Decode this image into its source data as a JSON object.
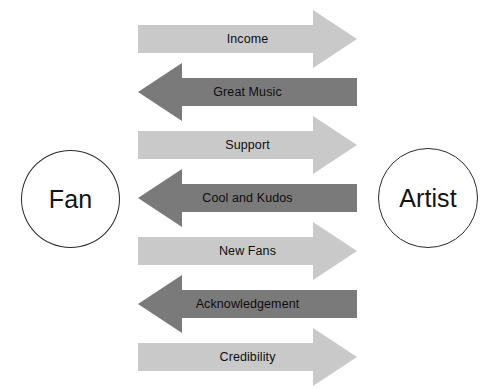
{
  "diagram": {
    "background_color": "#ffffff",
    "nodes": {
      "left": {
        "label": "Fan",
        "name": "fan-node"
      },
      "right": {
        "label": "Artist",
        "name": "Artist"
      }
    },
    "colors": {
      "arrow_right": "#c9c9c9",
      "arrow_left": "#7a7a7a",
      "node_outline": "#2b2b2b",
      "node_fill": "#ffffff",
      "text": "#0e0e0e"
    },
    "flows": [
      {
        "label": "Income",
        "direction": "right",
        "color": "#c9c9c9",
        "from": "Fan",
        "to": "Artist",
        "top": 10,
        "height": 58
      },
      {
        "label": "Great Music",
        "direction": "left",
        "color": "#7a7a7a",
        "from": "Artist",
        "to": "Fan",
        "top": 63,
        "height": 58
      },
      {
        "label": "Support",
        "direction": "right",
        "color": "#c9c9c9",
        "from": "Fan",
        "to": "Artist",
        "top": 116,
        "height": 58
      },
      {
        "label": "Cool and Kudos",
        "direction": "left",
        "color": "#7a7a7a",
        "from": "Artist",
        "to": "Fan",
        "top": 169,
        "height": 58
      },
      {
        "label": "New Fans",
        "direction": "right",
        "color": "#c9c9c9",
        "from": "Fan",
        "to": "Artist",
        "top": 222,
        "height": 58
      },
      {
        "label": "Acknowledgement",
        "direction": "left",
        "color": "#7a7a7a",
        "from": "Artist",
        "to": "Fan",
        "top": 275,
        "height": 58
      },
      {
        "label": "Credibility",
        "direction": "right",
        "color": "#c9c9c9",
        "from": "Fan",
        "to": "Artist",
        "top": 328,
        "height": 58
      }
    ]
  }
}
